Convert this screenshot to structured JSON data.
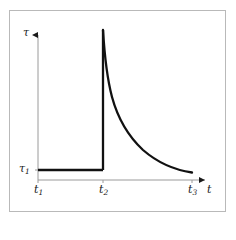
{
  "figure": {
    "type": "line-plot",
    "frame_color": "#b9b9b9",
    "background": "#ffffff",
    "curve_color": "#111111",
    "axis_color": "#9a9a9a",
    "dashed_color": "#aaaaaa"
  },
  "axes": {
    "y_axis_label": "τ",
    "x_axis_label": "t",
    "y_ticks": [
      {
        "name": "tau1",
        "label_main": "τ",
        "label_sub": "1",
        "pixel_y": 170
      }
    ],
    "x_ticks": [
      {
        "name": "t1",
        "label_main": "t",
        "label_sub": "1",
        "pixel_x": 38
      },
      {
        "name": "t2",
        "label_main": "t",
        "label_sub": "2",
        "pixel_x": 103
      },
      {
        "name": "t3",
        "label_main": "t",
        "label_sub": "3",
        "pixel_x": 192
      }
    ]
  },
  "chart_data": {
    "type": "line",
    "title": "",
    "xlabel": "t",
    "ylabel": "τ",
    "grid": false,
    "legend": false,
    "xlim": [
      38,
      210
    ],
    "ylim": [
      180,
      30
    ],
    "annotations": [
      {
        "name": "constant-plateau",
        "description": "constant shear stress tau1 between t1 and t2",
        "style": "solid-thick"
      },
      {
        "name": "vertical-jump",
        "description": "stress spike at t2 rising from tau1 to peak",
        "style": "solid-thick"
      },
      {
        "name": "hyperbolic-decay",
        "description": "monotonic decay from peak at t2 down toward tau1 at t3",
        "style": "solid-thick"
      },
      {
        "name": "dashed-marker-t2",
        "description": "vertical dashed guide line at t2",
        "style": "dashed"
      }
    ],
    "series": [
      {
        "name": "tau-of-t",
        "points": [
          {
            "x": 38,
            "y": 170
          },
          {
            "x": 103,
            "y": 170
          },
          {
            "x": 103,
            "y": 30
          },
          {
            "x": 106,
            "y": 52
          },
          {
            "x": 110,
            "y": 73
          },
          {
            "x": 115,
            "y": 92
          },
          {
            "x": 122,
            "y": 110
          },
          {
            "x": 131,
            "y": 127
          },
          {
            "x": 142,
            "y": 141
          },
          {
            "x": 155,
            "y": 153
          },
          {
            "x": 170,
            "y": 163
          },
          {
            "x": 182,
            "y": 168
          },
          {
            "x": 192,
            "y": 172
          }
        ]
      }
    ]
  }
}
